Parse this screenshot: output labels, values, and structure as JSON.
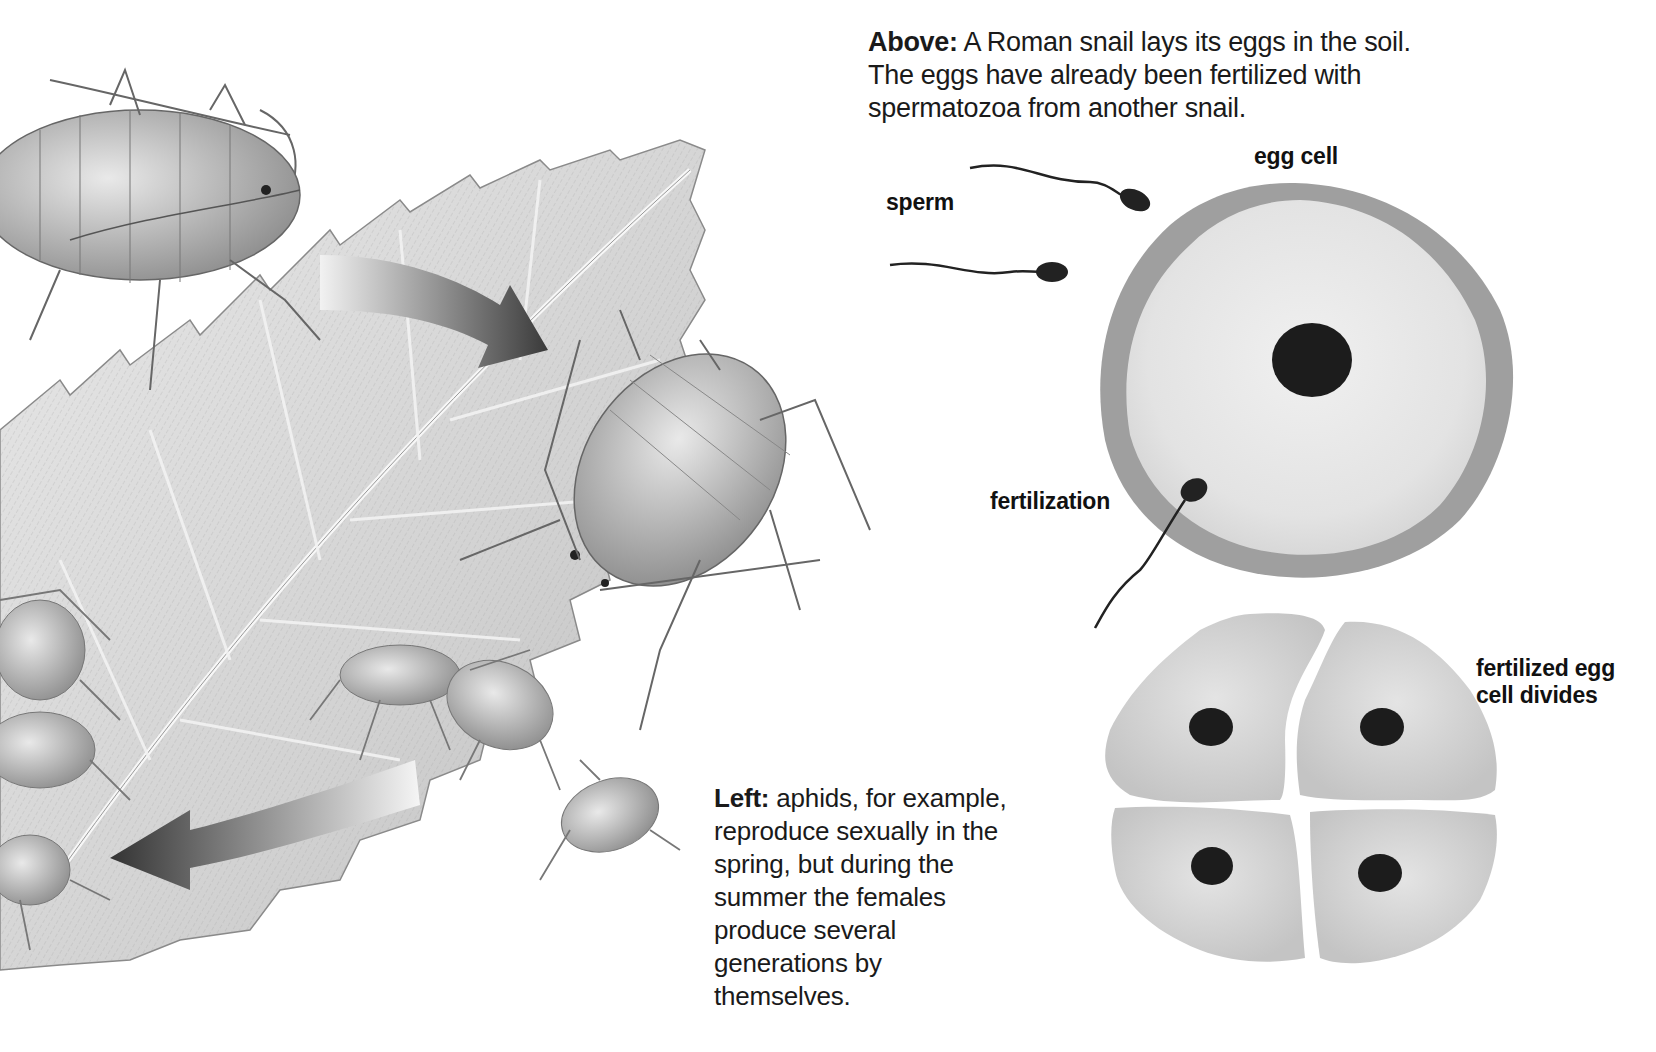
{
  "captions": {
    "above": {
      "lead": "Above:",
      "text": " A Roman snail lays its eggs in the soil. The eggs have already been fertilized with spermatozoa from another snail."
    },
    "left": {
      "lead": "Left:",
      "text": " aphids, for example, reproduce sexually in the spring, but during the summer the females produce several generations by themselves."
    }
  },
  "labels": {
    "sperm": "sperm",
    "egg_cell": "egg cell",
    "fertilization": "fertilization",
    "fertilized_line1": "fertilized egg",
    "fertilized_line2": "cell divides"
  },
  "illustrations": {
    "aphid_scene": "aphids-on-leaf",
    "egg_cell": "egg-cell-with-nucleus",
    "cell_division": "four-cell-division"
  },
  "colors": {
    "cell_fill": "#e6e6e6",
    "cell_border": "#9a9a9a",
    "nucleus": "#1c1c1c",
    "divided_cell": "#cfcfcf",
    "text": "#111111"
  }
}
